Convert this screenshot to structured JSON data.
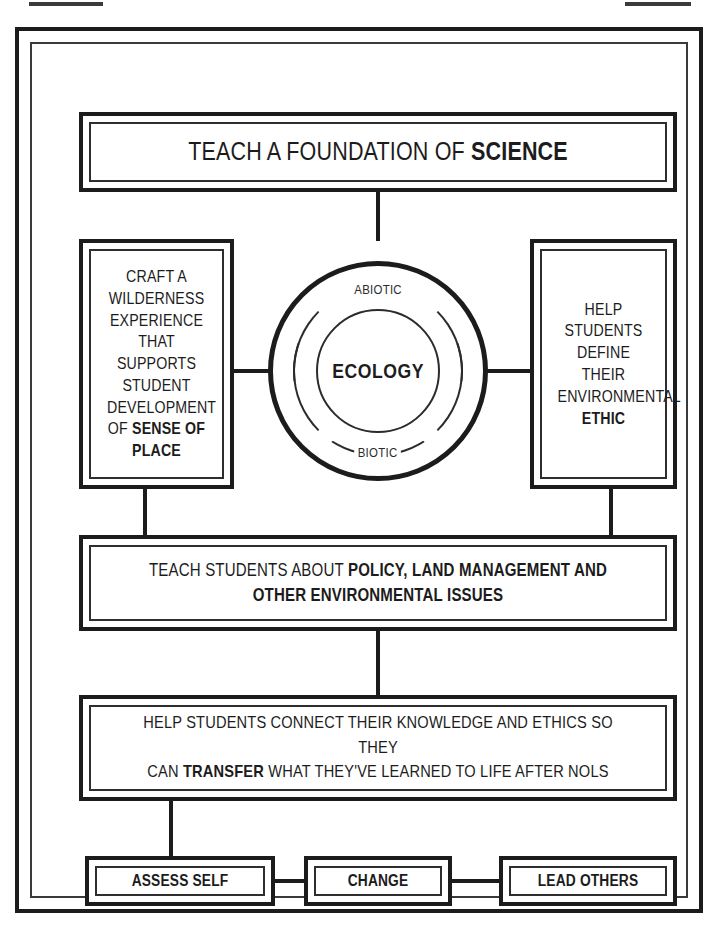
{
  "diagram": {
    "title_node": {
      "name": "teach-a-foundation-of-science",
      "text_plain": "TEACH A FOUNDATION OF SCIENCE",
      "text_normal": "TEACH A FOUNDATION OF ",
      "text_bold": "SCIENCE"
    },
    "left_node": {
      "name": "craft-a-wilderness-experience",
      "text_plain": "CRAFT A WILDERNESS EXPERIENCE THAT SUPPORTS STUDENT DEVELOPMENT OF SENSE OF PLACE",
      "text_normal": "CRAFT A\nWILDERNESS\nEXPERIENCE\nTHAT SUPPORTS\nSTUDENT\nDEVELOPMENT\nOF ",
      "text_bold": "SENSE OF\nPLACE"
    },
    "right_node": {
      "name": "help-students-define-ethic",
      "text_plain": "HELP STUDENTS DEFINE THEIR ENVIRONMENTAL ETHIC",
      "text_normal": "HELP STUDENTS\nDEFINE THEIR\nENVIRONMENTAL\n",
      "text_bold": "ETHIC"
    },
    "center_circle": {
      "name": "ecology-circle",
      "core_label": "ECOLOGY",
      "outer_ring_label": "ABIOTIC",
      "inner_ring_label": "BIOTIC"
    },
    "policy_node": {
      "name": "teach-students-about-policy",
      "text_plain": "TEACH STUDENTS ABOUT POLICY, LAND MANAGEMENT AND OTHER ENVIRONMENTAL ISSUES",
      "text_normal": "TEACH STUDENTS ABOUT ",
      "text_bold": "POLICY, LAND MANAGEMENT AND\nOTHER ENVIRONMENTAL ISSUES"
    },
    "transfer_node": {
      "name": "help-students-connect-knowledge",
      "text_plain": "HELP STUDENTS CONNECT THEIR KNOWLEDGE AND ETHICS SO THEY CAN TRANSFER WHAT THEY'VE LEARNED TO LIFE AFTER NOLS",
      "text_normal_1": "HELP STUDENTS CONNECT THEIR KNOWLEDGE AND ETHICS SO THEY\nCAN ",
      "text_bold": "TRANSFER",
      "text_normal_2": " WHAT THEY'VE LEARNED TO LIFE AFTER NOLS"
    },
    "outcome_nodes": [
      {
        "name": "assess-self",
        "label": "ASSESS SELF"
      },
      {
        "name": "change",
        "label": "CHANGE"
      },
      {
        "name": "lead-others",
        "label": "LEAD OTHERS"
      }
    ],
    "colors": {
      "stroke": "#1c1c1c",
      "stroke_light": "#2e2e2e",
      "background": "#ffffff"
    }
  }
}
